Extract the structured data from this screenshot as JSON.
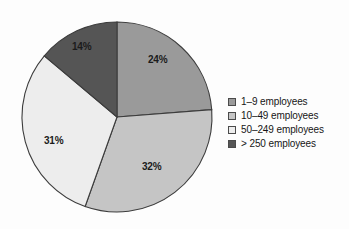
{
  "chart_data": {
    "type": "pie",
    "title": "",
    "subtitle": "",
    "xlabel": "",
    "ylabel": "",
    "grid": false,
    "legend_position": "right",
    "start_angle_deg": 0,
    "direction": "clockwise",
    "categories": [
      "1–9 employees",
      "10–49 employees",
      "50–249 employees",
      "> 250 employees"
    ],
    "values": [
      24,
      32,
      31,
      14
    ],
    "labels": [
      "24%",
      "32%",
      "31%",
      "14%"
    ],
    "colors": [
      "#9a9a9a",
      "#c5c5c5",
      "#ededed",
      "#555555"
    ],
    "slices": [
      {
        "label": "24%",
        "value": 24,
        "category": "1–9 employees",
        "color": "#9a9a9a"
      },
      {
        "label": "32%",
        "value": 32,
        "category": "10–49 employees",
        "color": "#c5c5c5"
      },
      {
        "label": "31%",
        "value": 31,
        "category": "50–249 employees",
        "color": "#ededed"
      },
      {
        "label": "14%",
        "value": 14,
        "category": "> 250 employees",
        "color": "#555555"
      }
    ]
  },
  "legend": {
    "items": [
      {
        "label": "1–9 employees",
        "color": "#9a9a9a"
      },
      {
        "label": "10–49 employees",
        "color": "#c5c5c5"
      },
      {
        "label": "50–249 employees",
        "color": "#ededed"
      },
      {
        "label": "> 250 employees",
        "color": "#555555"
      }
    ]
  },
  "style": {
    "outline_color": "#3c3c3c",
    "background": "#fdfdfd",
    "text_color": "#161616"
  }
}
